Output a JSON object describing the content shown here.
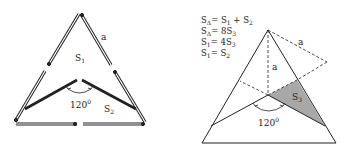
{
  "left_figure": {
    "side_label": "a",
    "region_1": {
      "base": "S",
      "sub": "1"
    },
    "region_2": {
      "base": "S",
      "sub": "2"
    },
    "angle": {
      "value": "120",
      "unit": "0"
    }
  },
  "right_figure": {
    "formulas": [
      {
        "lhs": {
          "base": "S",
          "sub": "Δ"
        },
        "rhs": "= S",
        "rhs_sub": "1",
        "tail": " + S",
        "tail_sub": "2"
      },
      {
        "lhs": {
          "base": "S",
          "sub": "Δ"
        },
        "rhs": "= 8S",
        "rhs_sub": "3",
        "tail": "",
        "tail_sub": ""
      },
      {
        "lhs": {
          "base": "S",
          "sub": "1"
        },
        "rhs": "= 4S",
        "rhs_sub": "3",
        "tail": "",
        "tail_sub": ""
      },
      {
        "lhs": {
          "base": "S",
          "sub": "1"
        },
        "rhs": "= S",
        "rhs_sub": "2",
        "tail": "",
        "tail_sub": ""
      }
    ],
    "side_label": "a",
    "height_label": "a",
    "shaded_region": {
      "base": "S",
      "sub": "3"
    },
    "angle": {
      "value": "120",
      "unit": "0"
    },
    "shade_color": "#a8a8a8"
  }
}
